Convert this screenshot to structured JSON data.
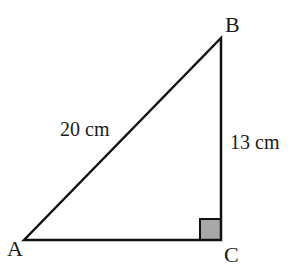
{
  "diagram": {
    "type": "right-triangle",
    "vertices": [
      {
        "name": "A",
        "x": 24,
        "y": 240
      },
      {
        "name": "B",
        "x": 221,
        "y": 38
      },
      {
        "name": "C",
        "x": 221,
        "y": 240
      }
    ],
    "labels": {
      "A": "A",
      "B": "B",
      "C": "C",
      "hypotenuse": "20 cm",
      "side_bc": "13 cm"
    },
    "right_angle_at": "C",
    "colors": {
      "stroke": "#111111",
      "right_angle_fill": "#a8a8a8"
    }
  }
}
